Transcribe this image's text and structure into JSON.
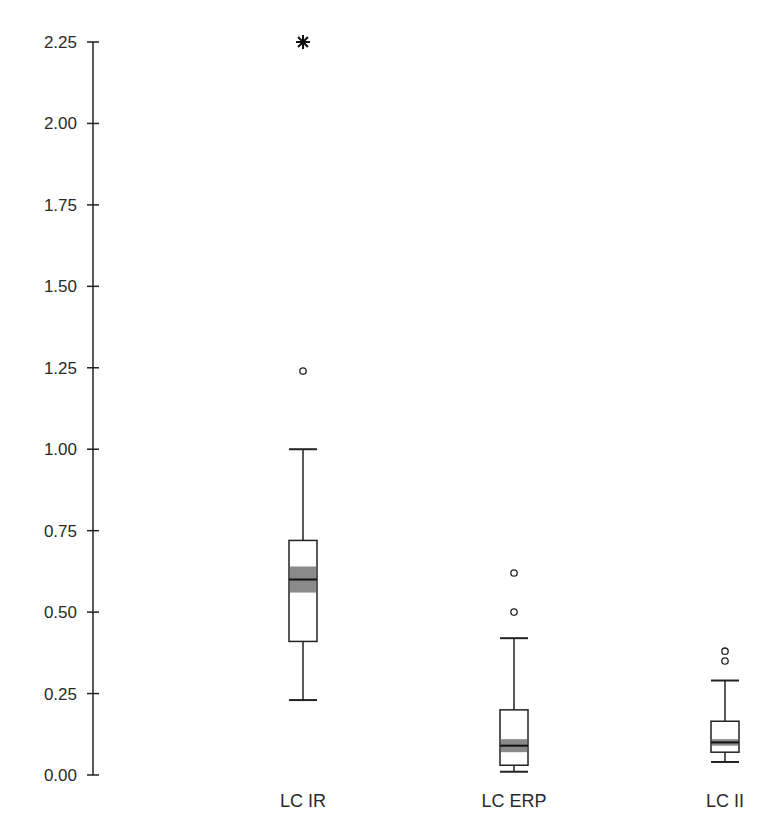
{
  "chart_data": {
    "type": "boxplot",
    "title": "",
    "xlabel": "",
    "ylabel": "",
    "ylim": [
      0,
      2.25
    ],
    "yticks": [
      "0.00",
      "0.25",
      "0.50",
      "0.75",
      "1.00",
      "1.25",
      "1.50",
      "1.75",
      "2.00",
      "2.25"
    ],
    "grid": false,
    "legend": null,
    "categories": [
      "LC IR",
      "LC ERP",
      "LC II"
    ],
    "series": [
      {
        "name": "LC IR",
        "whisker_low": 0.23,
        "q1": 0.41,
        "median": 0.6,
        "q3": 0.72,
        "whisker_high": 1.0,
        "ci_low": 0.56,
        "ci_high": 0.64,
        "outliers": [
          1.24
        ],
        "extremes": [
          2.25
        ]
      },
      {
        "name": "LC ERP",
        "whisker_low": 0.01,
        "q1": 0.03,
        "median": 0.09,
        "q3": 0.2,
        "whisker_high": 0.42,
        "ci_low": 0.07,
        "ci_high": 0.11,
        "outliers": [
          0.5,
          0.62
        ],
        "extremes": []
      },
      {
        "name": "LC II",
        "whisker_low": 0.04,
        "q1": 0.07,
        "median": 0.1,
        "q3": 0.165,
        "whisker_high": 0.29,
        "ci_low": 0.09,
        "ci_high": 0.11,
        "outliers": [
          0.35,
          0.38
        ],
        "extremes": []
      }
    ],
    "colors": {
      "box_fill": "#ffffff",
      "box_stroke": "#222222",
      "ci_shade": "#8a8a8a",
      "axis": "#222222"
    }
  }
}
